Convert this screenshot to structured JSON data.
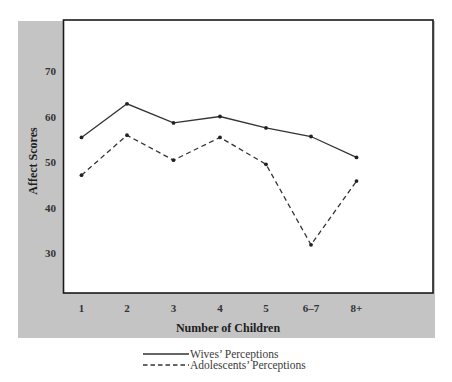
{
  "chart_data": {
    "type": "line",
    "title": "",
    "xlabel": "Number of Children",
    "ylabel": "Affect Scores",
    "categories": [
      "1",
      "2",
      "3",
      "4",
      "5",
      "6–7",
      "8+"
    ],
    "y_ticks": [
      30,
      40,
      50,
      60,
      70
    ],
    "ylim": [
      20,
      80
    ],
    "grid": false,
    "legend_position": "bottom-center",
    "series": [
      {
        "name": "Wives’ Perceptions",
        "style": "solid",
        "values": [
          55.4,
          62.8,
          58.6,
          60.0,
          57.5,
          55.6,
          51.0
        ]
      },
      {
        "name": "Adolescents’ Perceptions",
        "style": "dashed",
        "values": [
          47.1,
          55.9,
          50.4,
          55.4,
          49.5,
          31.8,
          45.8
        ]
      }
    ]
  },
  "colors": {
    "panel_gray": "#c4c4c4",
    "plot_background": "#ffffff",
    "frame": "#1a1a1a",
    "series_line": "#333333"
  }
}
